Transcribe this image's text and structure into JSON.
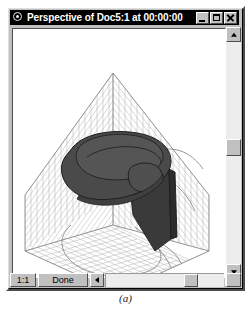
{
  "window": {
    "title": "Perspective of Doc5:1 at 00:00:00",
    "icon": "perspective-camera-icon",
    "controls": {
      "minimize_label": "minimize-icon",
      "maximize_label": "maximize-icon",
      "close_label": "close-icon"
    },
    "frame_color": "#c0c0c0",
    "titlebar_color": "#000000",
    "titlebar_text_color": "#ffffff"
  },
  "statusbar": {
    "scale_label": "1:1",
    "status_label": "Done",
    "hscroll_left_icon": "triangle-left-icon",
    "hscroll_right_icon": "triangle-right-icon"
  },
  "vscroll": {
    "up_icon": "triangle-up-icon",
    "down_icon": "triangle-down-icon"
  },
  "caption": "(a)",
  "viewport": {
    "background_color": "#ffffff",
    "grid_color": "#b9b9b9",
    "grid_edge_color": "#8a8a8a",
    "object_fill": "#4a4a4a",
    "object_fill_dark": "#3a3a3a",
    "object_fill_light": "#575757",
    "object_outline": "#1e1e1e",
    "shadow_outline_color": "#6e6e6e"
  }
}
